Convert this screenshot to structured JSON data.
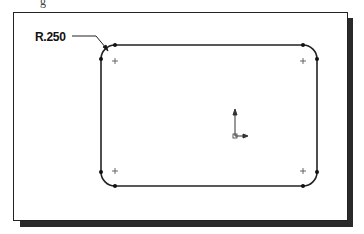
{
  "figure": {
    "cut_off_caption_fragment": "g",
    "dimension_label": "R.250",
    "sketch": {
      "shape": "rounded-rectangle",
      "corner_radius_label": "R.250",
      "corner_count": 4,
      "center_marks": 4,
      "origin_axes": true
    },
    "colors": {
      "line": "#222222",
      "shadow": "#2a2a2a",
      "background": "#ffffff"
    }
  }
}
